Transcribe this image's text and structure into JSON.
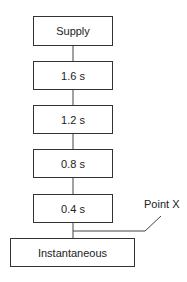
{
  "diagram": {
    "nodes": [
      {
        "id": "supply",
        "label": "Supply"
      },
      {
        "id": "t16",
        "label": "1.6 s"
      },
      {
        "id": "t12",
        "label": "1.2 s"
      },
      {
        "id": "t08",
        "label": "0.8 s"
      },
      {
        "id": "t04",
        "label": "0.4 s"
      },
      {
        "id": "inst",
        "label": "Instantaneous"
      }
    ],
    "edges": [
      [
        "supply",
        "t16"
      ],
      [
        "t16",
        "t12"
      ],
      [
        "t12",
        "t08"
      ],
      [
        "t08",
        "t04"
      ],
      [
        "t04",
        "inst"
      ]
    ],
    "annotation": {
      "label": "Point X",
      "points_to": "connection between 0.4 s and Instantaneous"
    }
  }
}
